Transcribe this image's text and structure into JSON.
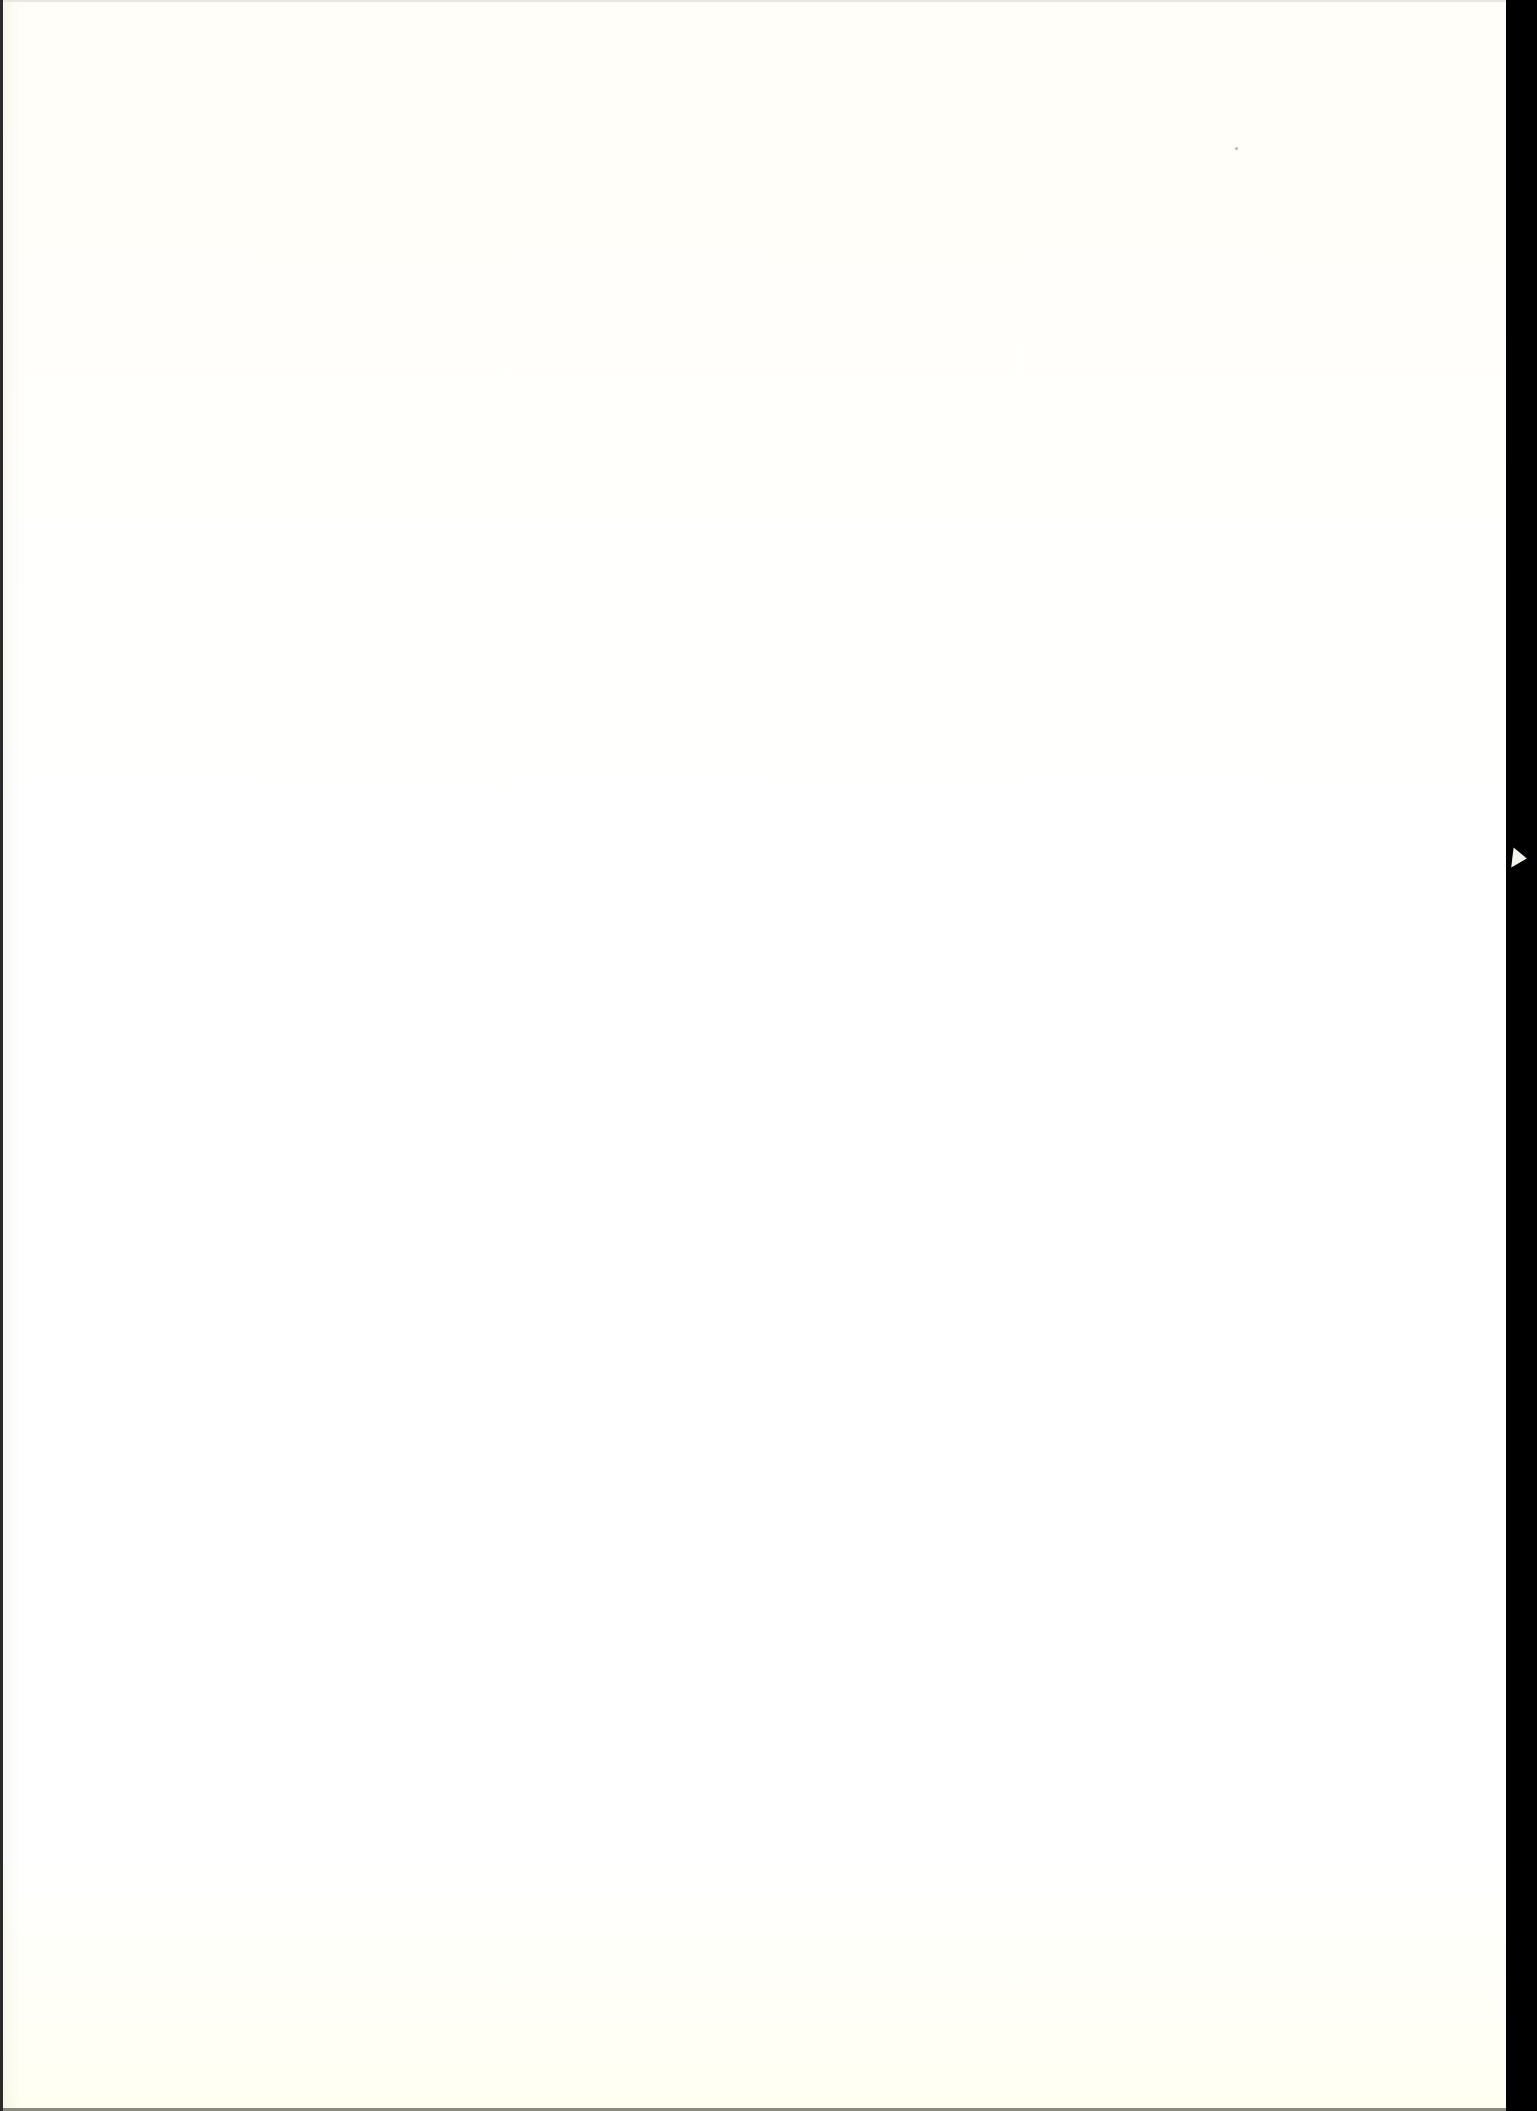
{
  "page": {
    "type": "scanned-blank-page",
    "text": "",
    "colors": {
      "paper": "#fffef8",
      "scan_border": "#000000",
      "left_edge": "#2a2a2a",
      "bottom_edge": "#8a8a80"
    }
  }
}
